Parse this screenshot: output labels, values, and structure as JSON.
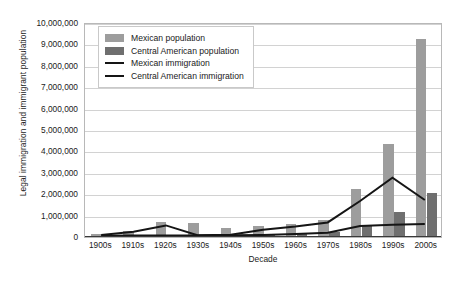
{
  "chart_data": {
    "type": "bar",
    "title": "",
    "xlabel": "Decade",
    "ylabel": "Legal immigration and immigrant population",
    "ylim": [
      0,
      10000000
    ],
    "ytick_values": [
      0,
      1000000,
      2000000,
      3000000,
      4000000,
      5000000,
      6000000,
      7000000,
      8000000,
      9000000,
      10000000
    ],
    "ytick_labels": [
      "0",
      "1,000,000",
      "2,000,000",
      "3,000,000",
      "4,000,000",
      "5,000,000",
      "6,000,000",
      "7,000,000",
      "8,000,000",
      "9,000,000",
      "10,000,000"
    ],
    "grid": true,
    "legend_position": "upper-left-inside",
    "categories": [
      "1900s",
      "1910s",
      "1920s",
      "1930s",
      "1940s",
      "1950s",
      "1960s",
      "1970s",
      "1980s",
      "1990s",
      "2000s"
    ],
    "series": [
      {
        "name": "Mexican population",
        "kind": "bar",
        "color": "#9d9d9d",
        "values": [
          100000,
          220000,
          640000,
          620000,
          380000,
          450000,
          580000,
          760000,
          2200000,
          4300000,
          9200000
        ]
      },
      {
        "name": "Central American population",
        "kind": "bar",
        "color": "#6f6f6f",
        "values": [
          20000,
          30000,
          40000,
          50000,
          60000,
          80000,
          120000,
          200000,
          450000,
          1100000,
          2000000
        ]
      },
      {
        "name": "Mexican immigration",
        "kind": "line",
        "color": "#151515",
        "values": [
          50000,
          200000,
          500000,
          30000,
          60000,
          300000,
          450000,
          640000,
          1650000,
          2750000,
          1700000
        ]
      },
      {
        "name": "Central American immigration",
        "kind": "line",
        "color": "#151515",
        "values": [
          10000,
          20000,
          20000,
          20000,
          30000,
          50000,
          100000,
          150000,
          470000,
          530000,
          570000
        ]
      }
    ]
  },
  "legend": {
    "items": [
      {
        "label": "Mexican population",
        "marker": "swatch-light"
      },
      {
        "label": "Central American population",
        "marker": "swatch-dark"
      },
      {
        "label": "Mexican immigration",
        "marker": "line"
      },
      {
        "label": "Central American immigration",
        "marker": "line"
      }
    ]
  }
}
